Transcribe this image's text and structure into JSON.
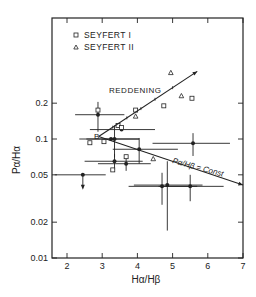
{
  "chart_data": {
    "type": "scatter",
    "title": "",
    "xlabel": "Hα/Hβ",
    "ylabel": "Pα/Hα",
    "xlim": [
      1.6,
      7
    ],
    "ylim": [
      0.01,
      0.6
    ],
    "yscale": "log",
    "xticks": [
      2,
      3,
      4,
      5,
      6,
      7
    ],
    "yticks": [
      0.01,
      0.02,
      0.05,
      0.1,
      0.2
    ],
    "ytick_labels": [
      "0.01",
      "0.02",
      "0.05",
      "0.1",
      "0.2"
    ],
    "grid": false,
    "legend": {
      "position": "upper left",
      "entries": [
        {
          "marker": "square-open",
          "label": "SEYFERT I"
        },
        {
          "marker": "triangle-open",
          "label": "SEYFERT II"
        }
      ]
    },
    "annotations": [
      {
        "text": "REDDENING",
        "type": "arrow-line",
        "from": [
          2.9,
          0.105
        ],
        "to": [
          5.7,
          0.37
        ]
      },
      {
        "text": "Pα/Hβ = Const",
        "type": "arrow-line",
        "from": [
          2.9,
          0.105
        ],
        "to": [
          7.0,
          0.041
        ]
      },
      {
        "text": "B",
        "x": 2.85,
        "y": 0.105
      }
    ],
    "series": [
      {
        "name": "SEYFERT I",
        "marker": "square-open",
        "points": [
          {
            "x": 2.65,
            "y": 0.093
          },
          {
            "x": 2.88,
            "y": 0.175
          },
          {
            "x": 3.05,
            "y": 0.095
          },
          {
            "x": 3.3,
            "y": 0.055
          },
          {
            "x": 3.45,
            "y": 0.13
          },
          {
            "x": 3.55,
            "y": 0.125
          },
          {
            "x": 3.68,
            "y": 0.071
          },
          {
            "x": 3.95,
            "y": 0.175
          },
          {
            "x": 4.75,
            "y": 0.19
          },
          {
            "x": 5.55,
            "y": 0.22
          }
        ]
      },
      {
        "name": "SEYFERT II",
        "marker": "triangle-open",
        "points": [
          {
            "x": 3.95,
            "y": 0.155
          },
          {
            "x": 4.45,
            "y": 0.068
          },
          {
            "x": 4.95,
            "y": 0.36
          },
          {
            "x": 5.25,
            "y": 0.23
          }
        ]
      },
      {
        "name": "Measured (error bars)",
        "marker": "filled-circle",
        "points": [
          {
            "x": 2.45,
            "y": 0.05,
            "xerr": [
              0.8,
              0.65
            ],
            "yerr_low": "upper-limit-arrow"
          },
          {
            "x": 2.88,
            "y": 0.16,
            "xerr": [
              0.65,
              0.75
            ],
            "yerr": [
              0.045,
              0.045
            ]
          },
          {
            "x": 3.25,
            "y": 0.1,
            "xerr": [
              0.9,
              0.8
            ]
          },
          {
            "x": 3.35,
            "y": 0.1,
            "xerr": [
              0.8,
              0.7
            ],
            "yerr": [
              0.03,
              0.03
            ]
          },
          {
            "x": 3.35,
            "y": 0.065,
            "xerr": [
              0.85,
              0.8
            ],
            "yerr": [
              0.01,
              0.01
            ]
          },
          {
            "x": 3.55,
            "y": 0.12,
            "xerr": [
              0.9,
              0.95
            ]
          },
          {
            "x": 3.68,
            "y": 0.062,
            "xerr": [
              0.8,
              0.7
            ],
            "yerr": [
              0.008,
              0.008
            ]
          },
          {
            "x": 4.05,
            "y": 0.082,
            "xerr": [
              0.75,
              1.1
            ],
            "yerr": [
              0.02,
              0.02
            ]
          },
          {
            "x": 4.7,
            "y": 0.04,
            "xerr": [
              0.95,
              1.0
            ],
            "yerr": [
              0.012,
              0.012
            ]
          },
          {
            "x": 4.85,
            "y": 0.041,
            "xerr": [
              0.95,
              1.0
            ],
            "yerr": [
              0.024,
              0.024
            ]
          },
          {
            "x": 5.5,
            "y": 0.04,
            "xerr": [
              0.9,
              0.95
            ],
            "yerr": [
              0.01,
              0.01
            ]
          },
          {
            "x": 5.58,
            "y": 0.092,
            "xerr": [
              1.15,
              1.05
            ],
            "yerr": [
              0.02,
              0.02
            ]
          }
        ]
      }
    ]
  }
}
